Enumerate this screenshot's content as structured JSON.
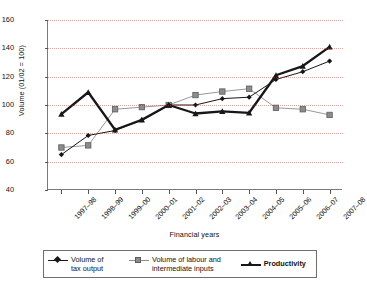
{
  "chart_data": {
    "type": "line",
    "title": "",
    "xlabel": "Financial years",
    "ylabel": "Volume (01/02 = 100)",
    "ylim": [
      40,
      160
    ],
    "yticks": [
      40,
      60,
      80,
      100,
      120,
      140,
      160
    ],
    "grid": true,
    "legend_position": "bottom",
    "categories": [
      "1997–98",
      "1998–99",
      "1999–00",
      "2000–01",
      "2001–02",
      "2002–03",
      "2003–04",
      "2004–05",
      "2005–06",
      "2006–07",
      "2007–08"
    ],
    "series": [
      {
        "name": "Volume of tax output",
        "marker": "diamond",
        "color": "#171717",
        "values": [
          65,
          78.5,
          82,
          89.5,
          100,
          100,
          104.5,
          105.5,
          118,
          123.5,
          131
        ]
      },
      {
        "name": "Volume of labour and intermediate inputs",
        "marker": "square",
        "color": "#8c8c8c",
        "values": [
          70,
          71.5,
          97,
          98.5,
          100,
          107,
          109.5,
          111.5,
          98,
          97,
          93
        ]
      },
      {
        "name": "Productivity",
        "marker": "triangle",
        "color": "#171717",
        "values": [
          93.5,
          109,
          82.5,
          89.5,
          100,
          94,
          95.5,
          94.5,
          121,
          127.5,
          141
        ]
      }
    ]
  },
  "legend": {
    "items": [
      {
        "label_line1": "Volume of",
        "label_line2": "tax output",
        "icon": "diamond-marker-icon",
        "bold": false
      },
      {
        "label_line1": "Volume of labour and",
        "label_line2": "intermediate inputs",
        "icon": "square-marker-icon",
        "bold": false
      },
      {
        "label_line1": "Productivity",
        "label_line2": "",
        "icon": "triangle-marker-icon",
        "bold": true
      }
    ]
  },
  "colors": {
    "series_tax_output": "#171717",
    "series_labour_inputs": "#8c8c8c",
    "series_productivity": "#171717",
    "gridline": "#c0392b",
    "axis": "#7a7a7a",
    "background": "#ffffff"
  }
}
